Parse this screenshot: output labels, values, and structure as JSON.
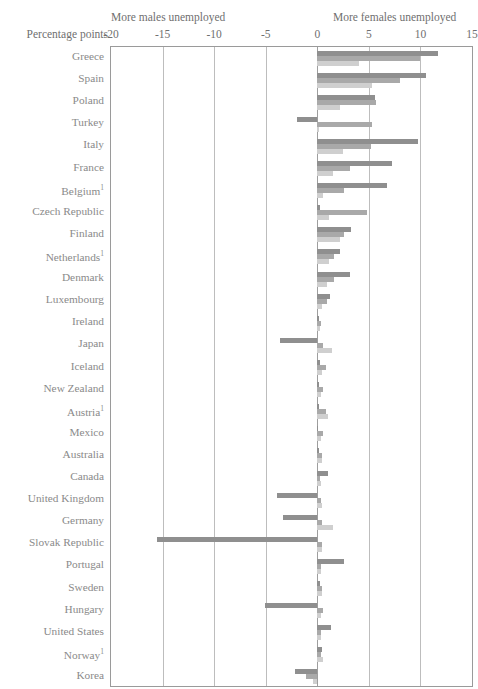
{
  "header": {
    "axis_title": "Percentage points",
    "note_left": "More males unemployed",
    "note_right": "More females unemployed"
  },
  "chart_data": {
    "type": "bar",
    "orientation": "horizontal",
    "title": "",
    "subtitle": "",
    "xlabel": "Percentage points",
    "ylabel": "",
    "xlim": [
      -20,
      15
    ],
    "xticks": [
      -20,
      -15,
      -10,
      -5,
      0,
      5,
      10,
      15
    ],
    "xtick_labels": [
      "-20",
      "-15",
      "-10",
      "-5",
      "0",
      "5",
      "10",
      "15"
    ],
    "grid": true,
    "legend": "none",
    "annotations": [
      "More males unemployed",
      "More females unemployed"
    ],
    "categories": [
      "Greece",
      "Spain",
      "Poland",
      "Turkey",
      "Italy",
      "France",
      "Belgium¹",
      "Czech Republic",
      "Finland",
      "Netherlands¹",
      "Denmark",
      "Luxembourg",
      "Ireland",
      "Japan",
      "Iceland",
      "New Zealand",
      "Austria¹",
      "Mexico",
      "Australia",
      "Canada",
      "United Kingdom",
      "Germany",
      "Slovak Republic",
      "Portugal",
      "Sweden",
      "Hungary",
      "United States",
      "Norway¹",
      "Korea"
    ],
    "series": [
      {
        "name": "series-1",
        "color": "#8f8f8f",
        "values": [
          11.7,
          10.5,
          5.6,
          -2.0,
          9.8,
          7.2,
          6.8,
          0.3,
          3.3,
          2.2,
          3.2,
          1.2,
          0.2,
          -3.6,
          0.3,
          0.2,
          0.2,
          0.1,
          0.2,
          1.0,
          -3.9,
          -3.3,
          -15.5,
          2.6,
          0.3,
          -5.1,
          1.3,
          0.5,
          -2.2
        ]
      },
      {
        "name": "series-2",
        "color": "#a9a9a9",
        "values": [
          10.0,
          8.0,
          5.7,
          5.3,
          5.2,
          3.2,
          2.6,
          4.8,
          2.6,
          1.6,
          1.6,
          0.9,
          0.4,
          0.6,
          0.8,
          0.6,
          0.8,
          0.6,
          0.5,
          0.3,
          0.4,
          0.5,
          0.5,
          0.4,
          0.5,
          0.6,
          0.4,
          0.4,
          -1.1
        ]
      },
      {
        "name": "series-3",
        "color": "#cfcfcf",
        "values": [
          4.0,
          5.3,
          2.2,
          0.2,
          2.5,
          1.5,
          0.6,
          1.1,
          2.2,
          1.1,
          0.9,
          0.5,
          0.3,
          1.4,
          0.5,
          0.4,
          1.0,
          0.4,
          0.5,
          0.4,
          0.5,
          1.5,
          0.5,
          0.4,
          0.5,
          0.4,
          0.4,
          0.6,
          -0.4
        ]
      }
    ]
  }
}
